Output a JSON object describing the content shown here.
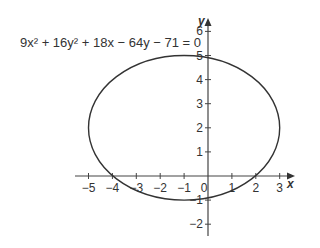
{
  "chart_data": {
    "type": "line",
    "title": "",
    "annotation": "9x² + 16y² + 18x − 64y − 71 = 0",
    "xlabel": "x",
    "ylabel": "y",
    "xlim": [
      -5,
      3
    ],
    "ylim": [
      -2,
      6
    ],
    "x_ticks": [
      -5,
      -4,
      -3,
      -2,
      -1,
      0,
      1,
      2,
      3
    ],
    "x_tick_labels": [
      "−5",
      "−4",
      "−3",
      "−2",
      "−1",
      "0",
      "1",
      "2",
      "3"
    ],
    "y_ticks": [
      -2,
      -1,
      1,
      2,
      3,
      4,
      5,
      6
    ],
    "y_tick_labels": [
      "−2",
      "−1",
      "1",
      "2",
      "3",
      "4",
      "5",
      "6"
    ],
    "grid": false,
    "legend": null,
    "series": [
      {
        "name": "ellipse",
        "shape": "ellipse",
        "center": [
          -1,
          2
        ],
        "semi_major_x": 4,
        "semi_minor_y": 3,
        "vertices": [
          [
            -5,
            2
          ],
          [
            3,
            2
          ]
        ],
        "co_vertices": [
          [
            -1,
            5
          ],
          [
            -1,
            -1
          ]
        ],
        "x_intercepts": [
          -3.98,
          1.98
        ],
        "y_intercepts": [
          -0.9,
          4.9
        ]
      }
    ]
  },
  "labels": {
    "equation": "9x² + 16y² + 18x − 64y − 71 = 0",
    "x_axis": "x",
    "y_axis": "y"
  }
}
